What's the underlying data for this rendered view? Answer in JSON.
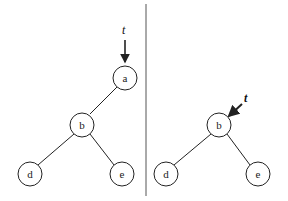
{
  "left_tree": {
    "pointer_label": "t",
    "nodes": [
      {
        "id": "a",
        "label": "a"
      },
      {
        "id": "b",
        "label": "b"
      },
      {
        "id": "d",
        "label": "d"
      },
      {
        "id": "e",
        "label": "e"
      }
    ],
    "edges": [
      [
        "a",
        "b"
      ],
      [
        "b",
        "d"
      ],
      [
        "b",
        "e"
      ]
    ],
    "pointer_target": "a"
  },
  "right_tree": {
    "pointer_label": "t",
    "nodes": [
      {
        "id": "b",
        "label": "b"
      },
      {
        "id": "d",
        "label": "d"
      },
      {
        "id": "e",
        "label": "e"
      }
    ],
    "edges": [
      [
        "b",
        "d"
      ],
      [
        "b",
        "e"
      ]
    ],
    "pointer_target": "b"
  },
  "colors": {
    "stroke": "#222222",
    "divider": "#555555",
    "background": "#ffffff"
  }
}
